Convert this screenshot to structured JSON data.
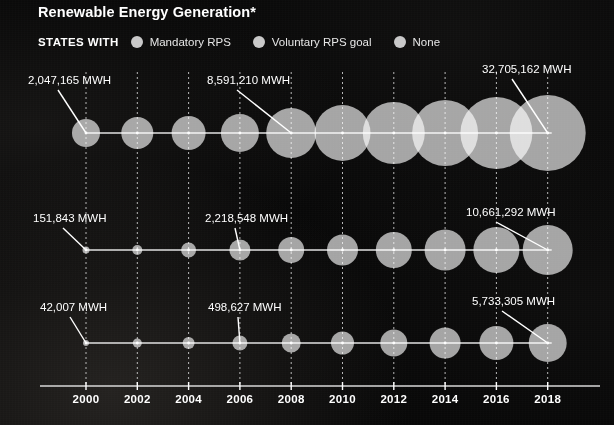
{
  "header": {
    "title": "Renewable Energy Generation*"
  },
  "legend": {
    "title": "STATES WITH",
    "items": [
      {
        "label": "Mandatory RPS",
        "color": "#c9c9c9",
        "icon": "circle-swatch-icon"
      },
      {
        "label": "Voluntary RPS goal",
        "color": "#c9c9c9",
        "icon": "circle-swatch-icon"
      },
      {
        "label": "None",
        "color": "#c9c9c9",
        "icon": "circle-swatch-icon"
      }
    ]
  },
  "chart_data": {
    "type": "scatter",
    "title": "Renewable Energy Generation*",
    "xlabel": "",
    "ylabel": "",
    "grid": true,
    "legend_position": "top-left",
    "size_encoding": "bubble area proportional to MWh",
    "x": [
      2000,
      2002,
      2004,
      2006,
      2008,
      2010,
      2012,
      2014,
      2016,
      2018
    ],
    "xticklabels": [
      "2000",
      "2002",
      "2004",
      "2006",
      "2008",
      "2010",
      "2012",
      "2014",
      "2016",
      "2018"
    ],
    "xlim": [
      1999,
      2019
    ],
    "units": "MWH",
    "series": [
      {
        "name": "Mandatory RPS",
        "row": 0,
        "values": [
          2047165,
          2700000,
          3200000,
          4300000,
          8591210,
          11500000,
          16000000,
          20500000,
          26000000,
          32705162
        ],
        "radii_px": [
          14,
          16,
          17,
          19,
          25,
          28,
          31,
          33,
          36,
          38
        ],
        "annotations": [
          {
            "year": 2000,
            "text": "2,047,165 MWH"
          },
          {
            "year": 2008,
            "text": "8,591,210 MWH"
          },
          {
            "year": 2018,
            "text": "32,705,162 MWH"
          }
        ]
      },
      {
        "name": "Voluntary RPS goal",
        "row": 1,
        "values": [
          151843,
          300000,
          700000,
          1500000,
          2218548,
          3600000,
          5200000,
          7000000,
          8700000,
          10661292
        ],
        "radii_px": [
          3.5,
          5,
          7.5,
          10.5,
          13,
          15.5,
          18,
          20.5,
          23,
          25
        ],
        "annotations": [
          {
            "year": 2000,
            "text": "151,843 MWH"
          },
          {
            "year": 2006,
            "text": "2,218,548 MWH"
          },
          {
            "year": 2018,
            "text": "10,661,292 MWH"
          }
        ]
      },
      {
        "name": "None",
        "row": 2,
        "values": [
          42007,
          150000,
          330000,
          498627,
          900000,
          1600000,
          2500000,
          3400000,
          4500000,
          5733305
        ],
        "radii_px": [
          3,
          4.5,
          6,
          7.5,
          9.5,
          11.5,
          13.5,
          15.5,
          17,
          19
        ],
        "annotations": [
          {
            "year": 2000,
            "text": "42,007 MWH"
          },
          {
            "year": 2006,
            "text": "498,627 MWH"
          },
          {
            "year": 2018,
            "text": "5,733,305 MWH"
          }
        ]
      }
    ],
    "annotation_labels": [
      "2,047,165 MWH",
      "8,591,210 MWH",
      "32,705,162 MWH",
      "151,843 MWH",
      "2,218,548 MWH",
      "10,661,292 MWH",
      "42,007 MWH",
      "498,627 MWH",
      "5,733,305 MWH"
    ]
  },
  "style": {
    "background": "#070707",
    "bubble_fill": "#c9c9c9",
    "line_color": "#e2e2e2",
    "grid_color": "#d5d5d5",
    "text_color": "#ffffff"
  }
}
